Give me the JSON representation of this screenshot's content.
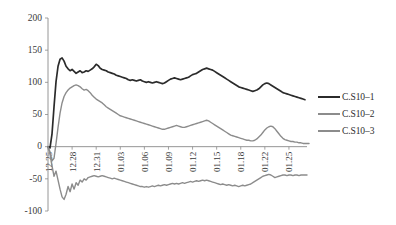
{
  "chart_data": {
    "type": "line",
    "title": "",
    "subtitle": "",
    "xlabel": "",
    "ylabel": "",
    "ylim": [
      -100,
      200
    ],
    "xlim": [
      0,
      32
    ],
    "grid": false,
    "legend_position": "right",
    "ytick_labels": [
      "200",
      "150",
      "100",
      "50",
      "0",
      "-50",
      "-100"
    ],
    "ytick_values": [
      200,
      150,
      100,
      50,
      0,
      -50,
      -100
    ],
    "xtick_labels": [
      "12.25",
      "12.28",
      "12.31",
      "01.03",
      "01.06",
      "01.09",
      "01.12",
      "01.15",
      "01.18",
      "01.22",
      "01.25"
    ],
    "xtick_values": [
      0,
      3,
      6,
      9,
      12,
      15,
      18,
      21,
      24,
      27,
      30
    ],
    "series": [
      {
        "name": "C.S10-1",
        "color": "#2b2b2b",
        "width": 1.7,
        "values": [
          0,
          -2,
          20,
          62,
          101,
          125,
          136,
          138,
          133,
          125,
          121,
          118,
          120,
          117,
          114,
          116,
          118,
          115,
          116,
          118,
          117,
          119,
          121,
          124,
          128,
          126,
          122,
          120,
          119,
          118,
          116,
          115,
          114,
          113,
          111,
          110,
          109,
          108,
          107,
          106,
          104,
          103,
          104,
          103,
          102,
          103,
          104,
          102,
          101,
          100,
          101,
          100,
          99,
          100,
          101,
          100,
          99,
          98,
          99,
          101,
          103,
          105,
          106,
          107,
          106,
          105,
          104,
          105,
          106,
          107,
          108,
          110,
          112,
          113,
          114,
          116,
          118,
          120,
          121,
          122,
          121,
          120,
          119,
          117,
          115,
          113,
          111,
          109,
          107,
          105,
          103,
          101,
          99,
          97,
          95,
          93,
          92,
          91,
          90,
          89,
          88,
          87,
          86,
          87,
          88,
          90,
          93,
          96,
          98,
          99,
          98,
          96,
          94,
          92,
          90,
          88,
          86,
          84,
          83,
          82,
          81,
          80,
          79,
          78,
          77,
          76,
          75,
          74,
          73
        ]
      },
      {
        "name": "C.S10-2",
        "color": "#8c8c8c",
        "width": 1.4,
        "values": [
          0,
          -8,
          -22,
          -18,
          5,
          30,
          52,
          68,
          78,
          84,
          88,
          91,
          93,
          95,
          96,
          95,
          93,
          90,
          88,
          89,
          87,
          84,
          80,
          77,
          74,
          72,
          70,
          68,
          65,
          62,
          60,
          58,
          56,
          54,
          52,
          50,
          48,
          47,
          46,
          45,
          44,
          43,
          42,
          41,
          40,
          39,
          38,
          37,
          36,
          35,
          34,
          33,
          32,
          31,
          30,
          29,
          28,
          27,
          27,
          28,
          29,
          30,
          31,
          32,
          33,
          32,
          31,
          30,
          30,
          31,
          32,
          33,
          34,
          35,
          36,
          37,
          38,
          39,
          40,
          41,
          40,
          38,
          36,
          34,
          32,
          30,
          28,
          26,
          24,
          22,
          20,
          18,
          17,
          16,
          15,
          14,
          13,
          12,
          11,
          10,
          10,
          9,
          9,
          10,
          12,
          15,
          18,
          22,
          26,
          29,
          31,
          32,
          31,
          28,
          24,
          20,
          16,
          13,
          11,
          10,
          9,
          8,
          8,
          7,
          7,
          6,
          6,
          5,
          5,
          5,
          5
        ]
      },
      {
        "name": "C.S10-3",
        "color": "#8c8c8c",
        "width": 1.4,
        "values": [
          0,
          -12,
          -30,
          -46,
          -38,
          -52,
          -66,
          -78,
          -82,
          -74,
          -62,
          -70,
          -58,
          -66,
          -56,
          -60,
          -52,
          -55,
          -50,
          -52,
          -48,
          -47,
          -46,
          -45,
          -46,
          -47,
          -46,
          -45,
          -46,
          -47,
          -48,
          -49,
          -50,
          -49,
          -50,
          -51,
          -52,
          -53,
          -54,
          -55,
          -56,
          -57,
          -58,
          -59,
          -60,
          -61,
          -62,
          -62,
          -63,
          -62,
          -63,
          -62,
          -61,
          -62,
          -61,
          -60,
          -61,
          -60,
          -59,
          -60,
          -59,
          -58,
          -57,
          -58,
          -57,
          -58,
          -57,
          -56,
          -57,
          -56,
          -55,
          -54,
          -55,
          -54,
          -53,
          -54,
          -53,
          -52,
          -53,
          -52,
          -53,
          -54,
          -55,
          -56,
          -57,
          -58,
          -59,
          -58,
          -59,
          -60,
          -59,
          -60,
          -61,
          -60,
          -61,
          -62,
          -61,
          -60,
          -61,
          -60,
          -59,
          -58,
          -56,
          -54,
          -52,
          -50,
          -48,
          -46,
          -45,
          -44,
          -43,
          -44,
          -46,
          -48,
          -47,
          -46,
          -45,
          -44,
          -44,
          -45,
          -44,
          -44,
          -45,
          -44,
          -44,
          -45,
          -44,
          -44,
          -44,
          -44
        ]
      }
    ]
  },
  "legend": {
    "items": [
      {
        "label": "C.S10–1",
        "color": "#2b2b2b"
      },
      {
        "label": "C.S10–2",
        "color": "#8c8c8c"
      },
      {
        "label": "C.S10–3",
        "color": "#8c8c8c"
      }
    ]
  }
}
